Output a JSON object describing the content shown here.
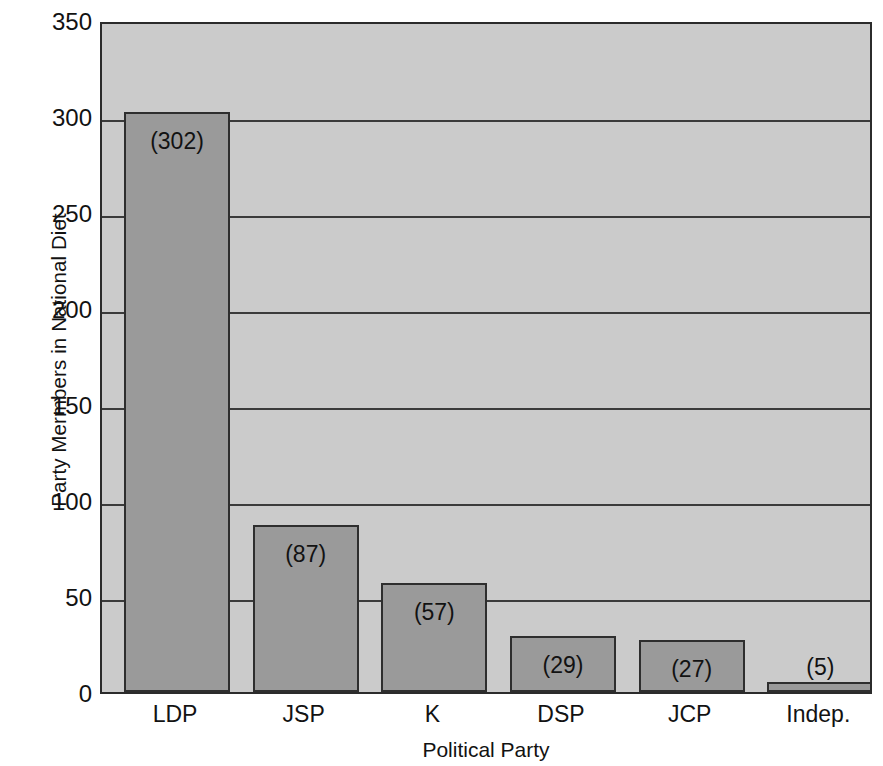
{
  "chart_data": {
    "type": "bar",
    "title": "",
    "xlabel": "Political Party",
    "ylabel": "Party Mermbers in National Diet",
    "categories": [
      "LDP",
      "JSP",
      "K",
      "DSP",
      "JCP",
      "Indep."
    ],
    "values": [
      302,
      87,
      57,
      29,
      27,
      5
    ],
    "value_labels": [
      "(302)",
      "(87)",
      "(57)",
      "(29)",
      "(27)",
      "(5)"
    ],
    "ylim": [
      0,
      350
    ],
    "ytick_labels": [
      "0",
      "50",
      "100",
      "150",
      "200",
      "250",
      "300",
      "350"
    ],
    "ytick_values": [
      0,
      50,
      100,
      150,
      200,
      250,
      300,
      350
    ],
    "grid": true,
    "legend": "none",
    "colors": {
      "plot_background": "#cbcbcb",
      "bar_fill": "#9a9a9a",
      "bar_border": "#2e2e2e",
      "gridline": "#3b3b3b",
      "axis": "#2b2b2b",
      "text": "#121212",
      "page_background": "#ffffff"
    }
  }
}
